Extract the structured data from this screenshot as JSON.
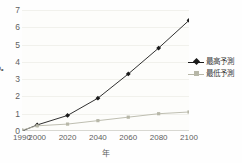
{
  "chart_data": {
    "type": "line",
    "title": "",
    "xlabel": "年",
    "ylabel": "℃",
    "categories": [
      "1990",
      "2000",
      "2020",
      "2040",
      "2060",
      "2080",
      "2100"
    ],
    "x": [
      1990,
      2000,
      2020,
      2040,
      2060,
      2080,
      2100
    ],
    "series": [
      {
        "name": "最高予測",
        "values": [
          0.0,
          0.35,
          0.9,
          1.9,
          3.3,
          4.8,
          6.4
        ],
        "color": "#1a1a1a",
        "marker": "diamond"
      },
      {
        "name": "最低予測",
        "values": [
          0.05,
          0.3,
          0.4,
          0.6,
          0.8,
          1.0,
          1.1
        ],
        "color": "#b7b7a8",
        "marker": "square"
      }
    ],
    "ylim": [
      0,
      7
    ],
    "yticks": [
      "0",
      "1",
      "2",
      "3",
      "4",
      "5",
      "6",
      "7"
    ],
    "xlim": [
      1990,
      2100
    ],
    "grid": true,
    "legend_position": "right"
  },
  "axes": {
    "y_title": "℃",
    "x_title": "年"
  },
  "legend": {
    "entries": [
      {
        "label": "最高予測"
      },
      {
        "label": "最低予測"
      }
    ]
  }
}
